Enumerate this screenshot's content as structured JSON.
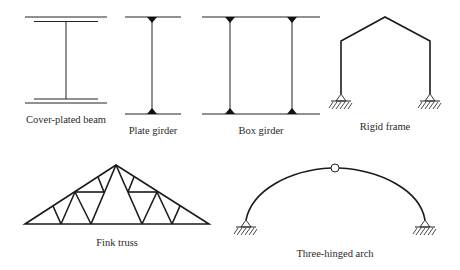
{
  "figures": [
    {
      "id": "cover-plated-beam",
      "label": "Cover-plated beam"
    },
    {
      "id": "plate-girder",
      "label": "Plate girder"
    },
    {
      "id": "box-girder",
      "label": "Box girder"
    },
    {
      "id": "rigid-frame",
      "label": "Rigid frame"
    },
    {
      "id": "fink-truss",
      "label": "Fink truss"
    },
    {
      "id": "three-hinged-arch",
      "label": "Three-hinged arch"
    }
  ],
  "colors": {
    "line": "#1a1a1a",
    "background": "#ffffff"
  }
}
